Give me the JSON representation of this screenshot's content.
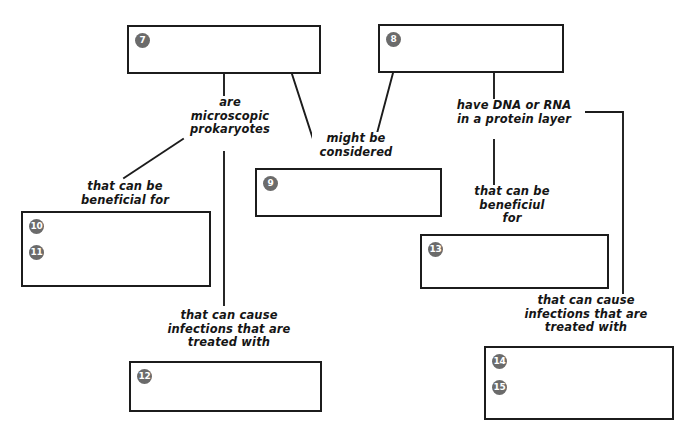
{
  "diagram": {
    "type": "concept-map-worksheet",
    "colors": {
      "box_border": "#1c1c1c",
      "badge_fill": "#6b6b6b",
      "badge_text": "#ffffff",
      "line": "#1c1c1c",
      "background": "#ffffff",
      "text": "#151515"
    },
    "boxes": [
      {
        "key": "box7",
        "badges": [
          "7"
        ],
        "x": 127,
        "y": 25,
        "w": 194,
        "h": 49
      },
      {
        "key": "box8",
        "badges": [
          "8"
        ],
        "x": 378,
        "y": 24,
        "w": 186,
        "h": 49
      },
      {
        "key": "box9",
        "badges": [
          "9"
        ],
        "x": 255,
        "y": 168,
        "w": 187,
        "h": 49
      },
      {
        "key": "box10",
        "badges": [
          "10",
          "11"
        ],
        "x": 21,
        "y": 211,
        "w": 190,
        "h": 76
      },
      {
        "key": "box12",
        "badges": [
          "12"
        ],
        "x": 129,
        "y": 361,
        "w": 193,
        "h": 51
      },
      {
        "key": "box13",
        "badges": [
          "13"
        ],
        "x": 420,
        "y": 234,
        "w": 189,
        "h": 55
      },
      {
        "key": "box14",
        "badges": [
          "14",
          "15"
        ],
        "x": 484,
        "y": 346,
        "w": 190,
        "h": 74
      }
    ],
    "labels": [
      {
        "key": "label_are_microscopic",
        "text": "are\nmicroscopic\nprokaryotes",
        "x": 185,
        "y": 96,
        "w": 86
      },
      {
        "key": "label_might_be_considered",
        "text": "might be\nconsidered",
        "x": 312,
        "y": 132,
        "w": 84
      },
      {
        "key": "label_have_dna_or_rna",
        "text": "have DNA or RNA\nin a protein layer",
        "x": 443,
        "y": 99,
        "w": 138
      },
      {
        "key": "label_beneficial_left",
        "text": "that can be\nbeneficial for",
        "x": 75,
        "y": 180,
        "w": 96
      },
      {
        "key": "label_beneficial_right",
        "text": "that can be\nbeneficiul\nfor",
        "x": 471,
        "y": 185,
        "w": 78
      },
      {
        "key": "label_infections_left",
        "text": "that can cause\ninfections that are\ntreated with",
        "x": 164,
        "y": 309,
        "w": 126
      },
      {
        "key": "label_infections_right",
        "text": "that can cause\ninfections that are\ntreated with",
        "x": 521,
        "y": 294,
        "w": 126
      }
    ],
    "connectors": [
      {
        "key": "wire-box7-to-are-microscopic",
        "kind": "vertical",
        "points": "224,74 224,95"
      },
      {
        "key": "wire-box7-to-might-be-considered",
        "kind": "diagonal",
        "points": "292,74 313,139"
      },
      {
        "key": "wire-box8-to-might-be-considered",
        "kind": "diagonal",
        "points": "393,73 376,137"
      },
      {
        "key": "wire-box8-to-have-dna-or-rna",
        "kind": "vertical",
        "points": "494,73 494,98"
      },
      {
        "key": "wire-are-microscopic-to-beneficial",
        "kind": "diagonal",
        "points": "183,139 124,178"
      },
      {
        "key": "wire-are-microscopic-to-box12",
        "kind": "vertical",
        "points": "224,152 224,305"
      },
      {
        "key": "wire-have-dna-to-beneficial-right",
        "kind": "vertical",
        "points": "494,140 494,185"
      },
      {
        "key": "wire-have-dna-elbow-to-infections",
        "kind": "elbow",
        "points": "582,112 623,112 623,296"
      }
    ]
  }
}
